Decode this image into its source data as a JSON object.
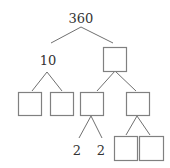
{
  "diagram": {
    "type": "factor-tree",
    "root": {
      "id": "n0",
      "label": "360",
      "x": 81,
      "y": 23,
      "kind": "text"
    },
    "nodes": [
      {
        "id": "n1",
        "label": "10",
        "x": 48,
        "y": 65,
        "kind": "text",
        "parent": "n0"
      },
      {
        "id": "n2",
        "label": "",
        "x": 103,
        "y": 47,
        "w": 23,
        "h": 24,
        "kind": "box",
        "parent": "n0"
      },
      {
        "id": "n3",
        "label": "",
        "x": 18,
        "y": 92,
        "w": 23,
        "h": 23,
        "kind": "box",
        "parent": "n1"
      },
      {
        "id": "n4",
        "label": "",
        "x": 50,
        "y": 92,
        "w": 23,
        "h": 23,
        "kind": "box",
        "parent": "n1"
      },
      {
        "id": "n5",
        "label": "",
        "x": 80,
        "y": 92,
        "w": 23,
        "h": 23,
        "kind": "box",
        "parent": "n2"
      },
      {
        "id": "n6",
        "label": "",
        "x": 126,
        "y": 92,
        "w": 23,
        "h": 23,
        "kind": "box",
        "parent": "n2"
      },
      {
        "id": "n7",
        "label": "2",
        "x": 77,
        "y": 155,
        "kind": "text",
        "parent": "n5"
      },
      {
        "id": "n8",
        "label": "2",
        "x": 101,
        "y": 155,
        "kind": "text",
        "parent": "n5"
      },
      {
        "id": "n9",
        "label": "",
        "x": 114,
        "y": 136,
        "w": 23,
        "h": 24,
        "kind": "box",
        "parent": "n6"
      },
      {
        "id": "n10",
        "label": "",
        "x": 139,
        "y": 136,
        "w": 24,
        "h": 24,
        "kind": "box",
        "parent": "n6"
      }
    ],
    "edges": [
      {
        "from": "n0",
        "to": "n1",
        "x1": 81,
        "y1": 27,
        "x2": 51,
        "y2": 43
      },
      {
        "from": "n0",
        "to": "n2",
        "x1": 81,
        "y1": 27,
        "x2": 113,
        "y2": 43
      },
      {
        "from": "n1",
        "to": "n3",
        "x1": 47,
        "y1": 72,
        "x2": 32,
        "y2": 91
      },
      {
        "from": "n1",
        "to": "n4",
        "x1": 47,
        "y1": 72,
        "x2": 62,
        "y2": 91
      },
      {
        "from": "n2",
        "to": "n5",
        "x1": 115,
        "y1": 71,
        "x2": 97,
        "y2": 91
      },
      {
        "from": "n2",
        "to": "n6",
        "x1": 115,
        "y1": 71,
        "x2": 136,
        "y2": 91
      },
      {
        "from": "n5",
        "to": "n7",
        "x1": 91,
        "y1": 116,
        "x2": 79,
        "y2": 138
      },
      {
        "from": "n5",
        "to": "n8",
        "x1": 91,
        "y1": 116,
        "x2": 102,
        "y2": 138
      },
      {
        "from": "n6",
        "to": "n9",
        "x1": 137,
        "y1": 116,
        "x2": 126,
        "y2": 135
      },
      {
        "from": "n6",
        "to": "n10",
        "x1": 137,
        "y1": 116,
        "x2": 150,
        "y2": 135
      }
    ],
    "colors": {
      "line": "#707070",
      "box_border": "#808080",
      "text": "#333333",
      "background": "#ffffff"
    }
  }
}
